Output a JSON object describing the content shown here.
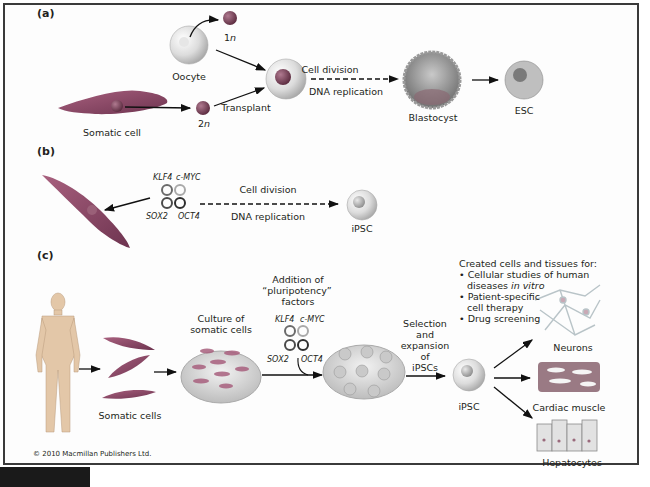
{
  "panels": {
    "a": {
      "label": "(a)",
      "oocyte": "Oocyte",
      "haploid": "1",
      "haploid_n": "n",
      "somatic_cell": "Somatic cell",
      "diploid": "2",
      "diploid_n": "n",
      "transplant": "Transplant",
      "cell_division": "Cell division",
      "dna_replication": "DNA replication",
      "blastocyst": "Blastocyst",
      "esc": "ESC"
    },
    "b": {
      "label": "(b)",
      "factors": [
        "KLF4",
        "c-MYC",
        "SOX2",
        "OCT4"
      ],
      "cell_division": "Cell division",
      "dna_replication": "DNA replication",
      "ipsc": "iPSC"
    },
    "c": {
      "label": "(c)",
      "somatic_cells": "Somatic cells",
      "culture_line1": "Culture of",
      "culture_line2": "somatic cells",
      "addition_line1": "Addition of",
      "addition_line2": "“pluripotency”",
      "addition_line3": "factors",
      "factors": [
        "KLF4",
        "c-MYC",
        "SOX2",
        "OCT4"
      ],
      "selection_lines": [
        "Selection",
        "and",
        "expansion",
        "of",
        "iPSCs"
      ],
      "ipsc": "iPSC",
      "uses_title": "Created cells and tissues for:",
      "uses": [
        {
          "line1": "Cellular studies of human",
          "line2": "diseases ",
          "line2_italic": "in vitro"
        },
        {
          "line1": "Patient-specific",
          "line2": "cell therapy"
        },
        {
          "line1": "Drug screening"
        }
      ],
      "outputs": [
        "Neurons",
        "Cardiac muscle",
        "Hepatocytes"
      ]
    }
  },
  "copyright": "© 2010 Macmillan Publishers Ltd.",
  "colors": {
    "frame": "#3a3a3a",
    "somatic_cell": "#8a4a66",
    "nucleus": "#7a3a52",
    "stem_cell": "#d9d9d9",
    "klf4_ring": "#6b6b6b",
    "cmyc_ring": "#a9a9a9",
    "sox2_ring": "#4a4a4a",
    "oct4_ring": "#2e2e2e",
    "dish": "#d6d6d6"
  }
}
